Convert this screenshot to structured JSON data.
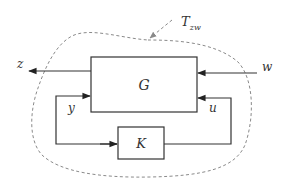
{
  "diagram": {
    "type": "block-diagram",
    "title_annotation": "T",
    "title_annotation_subscript": "zw",
    "blocks": [
      {
        "id": "G",
        "label": "G"
      },
      {
        "id": "K",
        "label": "K"
      }
    ],
    "signals": {
      "z": "z",
      "w": "w",
      "y": "y",
      "u": "u"
    },
    "connections": [
      {
        "from": "G",
        "to": "outside",
        "signal": "z"
      },
      {
        "from": "outside",
        "to": "G",
        "signal": "w"
      },
      {
        "from": "G",
        "to": "K",
        "signal": "y"
      },
      {
        "from": "K",
        "to": "G",
        "signal": "u"
      }
    ],
    "colors": {
      "line": "#333333",
      "dashed_boundary": "#8a8a8a",
      "background": "#ffffff"
    }
  }
}
